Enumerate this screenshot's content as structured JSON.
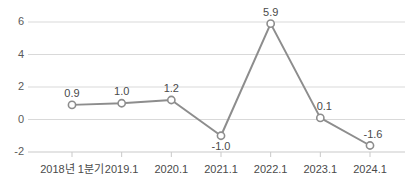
{
  "chart_data": {
    "type": "line",
    "title": "",
    "subtitle": "",
    "xlabel": "",
    "ylabel": "",
    "categories": [
      "2018년 1분기",
      "2019.1",
      "2020.1",
      "2021.1",
      "2022.1",
      "2023.1",
      "2024.1"
    ],
    "values": [
      0.9,
      1.0,
      1.2,
      -1.0,
      5.9,
      0.1,
      -1.6
    ],
    "point_labels": [
      "0.9",
      "1.0",
      "1.2",
      "-1.0",
      "5.9",
      "0.1",
      "-1.6"
    ],
    "label_positions": [
      "above",
      "above",
      "above",
      "below",
      "above",
      "above",
      "above"
    ],
    "yticks": [
      6,
      4,
      2,
      0,
      -2
    ],
    "ytick_labels": [
      "6",
      "4",
      "2",
      "0",
      "-2"
    ],
    "ylim": [
      -2,
      6
    ],
    "grid": true,
    "legend": "none",
    "series": [
      {
        "name": "",
        "values": [
          0.9,
          1.0,
          1.2,
          -1.0,
          5.9,
          0.1,
          -1.6
        ]
      }
    ]
  },
  "style": {
    "line_color": "#8d8d8d",
    "marker_fill": "#ffffff",
    "marker_stroke": "#8d8d8d",
    "grid_color": "#d9d9d9",
    "axis_color": "#c9c9c9",
    "tick_text_color": "#4a4a4a",
    "background": "#ffffff"
  }
}
